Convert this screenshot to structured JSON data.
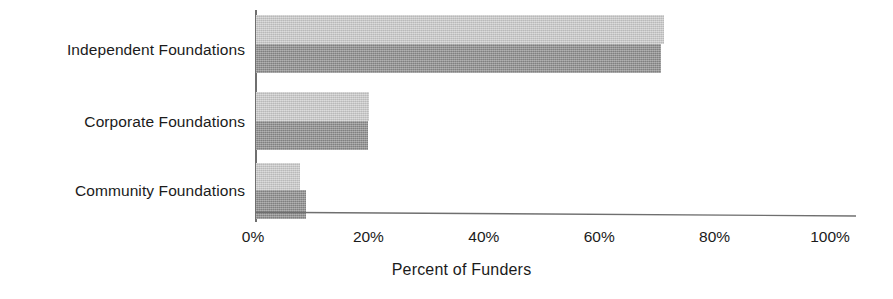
{
  "chart_data": {
    "type": "bar",
    "orientation": "horizontal",
    "title": "",
    "subtitle": "",
    "xlabel": "Percent of Funders",
    "ylabel": "",
    "categories": [
      "Independent Foundations",
      "Corporate Foundations",
      "Community Foundations"
    ],
    "series": [
      {
        "name": "Series 1",
        "color": "#cbcbcb",
        "values": [
          71,
          20,
          8
        ]
      },
      {
        "name": "Series 2",
        "color": "#8c8c8c",
        "values": [
          70.5,
          19.8,
          9
        ]
      }
    ],
    "xlim": [
      0,
      100
    ],
    "xtick_values": [
      0,
      20,
      40,
      60,
      80,
      100
    ],
    "xtick_labels": [
      "0%",
      "20%",
      "40%",
      "60%",
      "80%",
      "100%"
    ],
    "grid": false,
    "legend": "none",
    "value_labels": false,
    "axis_color": "#6f6f6f",
    "text_color": "#1b1b1b",
    "background": "#ffffff"
  }
}
